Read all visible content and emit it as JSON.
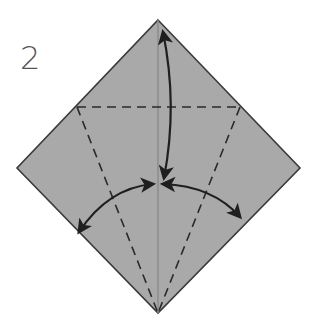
{
  "step": {
    "number": "2"
  },
  "diagram": {
    "paper_color": "#a9a9a9",
    "outline_color": "#3a3a3a",
    "crease_color": "#888888",
    "line_color": "#2a2a2a",
    "vertices": {
      "top": [
        158,
        20
      ],
      "left": [
        17,
        168
      ],
      "right": [
        300,
        168
      ],
      "bottom": [
        158,
        313
      ]
    },
    "valley_folds": [
      {
        "name": "horizontal",
        "from": [
          76,
          107
        ],
        "to": [
          240,
          107
        ]
      },
      {
        "name": "left-diagonal",
        "from": [
          76,
          107
        ],
        "to": [
          158,
          313
        ]
      },
      {
        "name": "right-diagonal",
        "from": [
          240,
          107
        ],
        "to": [
          158,
          313
        ]
      }
    ],
    "arrows": [
      {
        "name": "top-flap-fold-down",
        "direction": "double-headed",
        "from": [
          162,
          30
        ],
        "to": [
          162,
          178
        ]
      },
      {
        "name": "left-flap-unfold",
        "direction": "double-headed",
        "from": [
          152,
          184
        ],
        "to": [
          78,
          233
        ]
      },
      {
        "name": "right-flap-unfold",
        "direction": "double-headed",
        "from": [
          164,
          184
        ],
        "to": [
          240,
          218
        ]
      }
    ]
  }
}
